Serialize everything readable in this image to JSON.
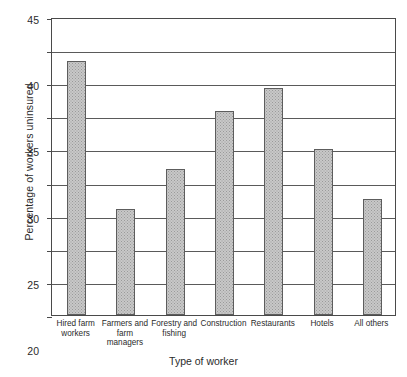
{
  "chart_data": {
    "type": "bar",
    "title": "",
    "xlabel": "Type of worker",
    "ylabel": "Percentage of workers uninsured",
    "ylim": [
      0,
      45
    ],
    "ytick_step": 5,
    "yticks": [
      45,
      40,
      35,
      30,
      25,
      20,
      15,
      10,
      5,
      0
    ],
    "grid": "horizontal",
    "legend": "none",
    "categories": [
      "Hired farm workers",
      "Farmers and farm managers",
      "Forestry and fishing",
      "Construction",
      "Restaurants",
      "Hotels",
      "All others"
    ],
    "category_lines": [
      [
        "Hired farm",
        "workers"
      ],
      [
        "Farmers and",
        "farm",
        "managers"
      ],
      [
        "Forestry and",
        "fishing"
      ],
      [
        "Construction"
      ],
      [
        "Restaurants"
      ],
      [
        "Hotels"
      ],
      [
        "All others"
      ]
    ],
    "values": [
      38.3,
      16.0,
      22.1,
      30.8,
      34.3,
      25.0,
      17.5
    ],
    "bar_fill": "#c8c8c8",
    "bar_stroke": "#5d5d5d",
    "axis_color": "#4a4a4a",
    "grid_color": "#5a5a5a",
    "background": "#ffffff"
  }
}
